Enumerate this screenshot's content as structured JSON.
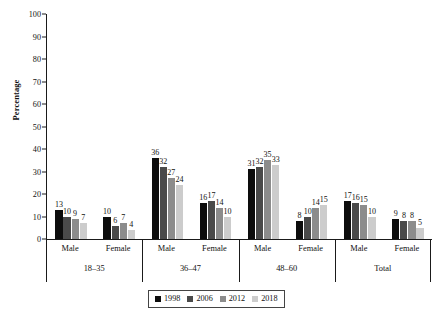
{
  "chart_data": {
    "type": "bar",
    "title": "",
    "xlabel": "",
    "ylabel": "Percentage",
    "ylim": [
      0,
      100
    ],
    "yticks": [
      0,
      10,
      20,
      30,
      40,
      50,
      60,
      70,
      80,
      90,
      100
    ],
    "grid": false,
    "legend_position": "bottom",
    "categories": [
      "18–35 Male",
      "18–35 Female",
      "36–47 Male",
      "36–47 Female",
      "48–60 Male",
      "48–60 Female",
      "Total Male",
      "Total Female"
    ],
    "group_labels": [
      "18–35",
      "36–47",
      "48–60",
      "Total"
    ],
    "sex_labels": [
      "Male",
      "Female",
      "Male",
      "Female",
      "Male",
      "Female",
      "Male",
      "Female"
    ],
    "series": [
      {
        "name": "1998",
        "color": "#0d0d0d",
        "values": [
          13,
          10,
          36,
          16,
          31,
          8,
          17,
          9
        ]
      },
      {
        "name": "2006",
        "color": "#4a4a4a",
        "values": [
          10,
          6,
          32,
          17,
          32,
          10,
          16,
          8
        ]
      },
      {
        "name": "2012",
        "color": "#8c8c8c",
        "values": [
          9,
          7,
          27,
          14,
          35,
          14,
          15,
          8
        ]
      },
      {
        "name": "2018",
        "color": "#cccccc",
        "values": [
          7,
          4,
          24,
          10,
          33,
          15,
          10,
          5
        ]
      }
    ]
  },
  "axis": {
    "y_title": "Percentage"
  }
}
